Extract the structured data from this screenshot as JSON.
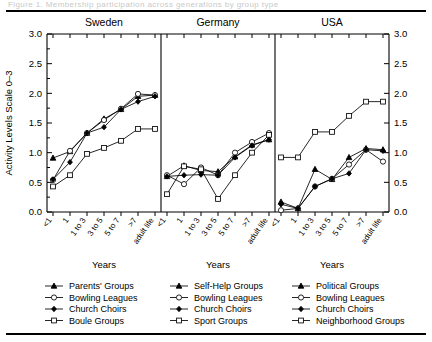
{
  "figure": {
    "ghost_title_fragment": "Figure 1.  Membership participation across generations by group type",
    "y_axis_label": "Activity Levels Scale 0–3",
    "x_axis_label": "Years",
    "y_ticks": [
      "0.0",
      "0.5",
      "1.0",
      "1.5",
      "2.0",
      "2.5",
      "3.0"
    ],
    "x_ticks": [
      "<1",
      "1",
      "1 to 3",
      "3 to 5",
      "5 to 7",
      ">7",
      "adult life"
    ]
  },
  "chart_data": {
    "type": "line",
    "title": "",
    "xlabel": "Years",
    "ylabel": "Activity Levels Scale 0–3",
    "ylim": [
      0,
      3
    ],
    "ytick_step": 0.5,
    "grid": false,
    "legend_position": "bottom",
    "categories": [
      "<1",
      "1",
      "1 to 3",
      "3 to 5",
      "5 to 7",
      ">7",
      "adult life"
    ],
    "panels": [
      {
        "name": "Sweden",
        "series": [
          {
            "name": "Parents' Groups",
            "marker": "triangle-filled",
            "values": [
              0.91,
              1.02,
              1.33,
              1.57,
              1.73,
              1.95,
              1.97
            ]
          },
          {
            "name": "Bowling Leagues",
            "marker": "circle-open",
            "values": [
              0.54,
              1.03,
              1.33,
              1.55,
              1.74,
              1.99,
              1.97
            ]
          },
          {
            "name": "Church Choirs",
            "marker": "diamond-filled",
            "values": [
              0.55,
              0.84,
              1.33,
              1.43,
              1.73,
              1.86,
              1.95
            ]
          },
          {
            "name": "Boule Groups",
            "marker": "square-open",
            "values": [
              0.43,
              0.62,
              0.98,
              1.08,
              1.2,
              1.4,
              1.4
            ]
          }
        ]
      },
      {
        "name": "Germany",
        "series": [
          {
            "name": "Self-Help Groups",
            "marker": "triangle-filled",
            "values": [
              0.6,
              0.78,
              0.7,
              0.68,
              0.93,
              1.13,
              1.22
            ]
          },
          {
            "name": "Bowling Leagues",
            "marker": "circle-open",
            "values": [
              0.62,
              0.47,
              0.75,
              0.62,
              1.0,
              1.18,
              1.33
            ]
          },
          {
            "name": "Church Choirs",
            "marker": "diamond-filled",
            "values": [
              0.6,
              0.62,
              0.63,
              0.62,
              0.92,
              1.12,
              1.22
            ]
          },
          {
            "name": "Sport Groups",
            "marker": "square-open",
            "values": [
              0.3,
              0.77,
              0.72,
              0.22,
              0.62,
              1.0,
              1.3
            ]
          }
        ]
      },
      {
        "name": "USA",
        "series": [
          {
            "name": "Political Groups",
            "marker": "triangle-filled",
            "values": [
              0.17,
              0.06,
              0.72,
              0.55,
              0.92,
              1.07,
              1.05
            ]
          },
          {
            "name": "Bowling Leagues",
            "marker": "circle-open",
            "values": [
              0.03,
              0.06,
              0.43,
              0.56,
              0.8,
              1.05,
              0.85
            ]
          },
          {
            "name": "Church Choirs",
            "marker": "diamond-filled",
            "values": [
              0.13,
              0.06,
              0.43,
              0.56,
              0.65,
              1.05,
              1.03
            ]
          },
          {
            "name": "Neighborhood Groups",
            "marker": "square-open",
            "values": [
              0.92,
              0.92,
              1.35,
              1.35,
              1.62,
              1.86,
              1.86
            ]
          }
        ]
      }
    ]
  },
  "legend": {
    "columns": [
      {
        "panel": "Sweden",
        "entries": [
          {
            "label": "Parents' Groups",
            "marker": "triangle-filled"
          },
          {
            "label": "Bowling Leagues",
            "marker": "circle-open"
          },
          {
            "label": "Church Choirs",
            "marker": "diamond-filled"
          },
          {
            "label": "Boule Groups",
            "marker": "square-open"
          }
        ]
      },
      {
        "panel": "Germany",
        "entries": [
          {
            "label": "Self-Help Groups",
            "marker": "triangle-filled"
          },
          {
            "label": "Bowling Leagues",
            "marker": "circle-open"
          },
          {
            "label": "Church Choirs",
            "marker": "diamond-filled"
          },
          {
            "label": "Sport Groups",
            "marker": "square-open"
          }
        ]
      },
      {
        "panel": "USA",
        "entries": [
          {
            "label": "Political Groups",
            "marker": "triangle-filled"
          },
          {
            "label": "Bowling Leagues",
            "marker": "circle-open"
          },
          {
            "label": "Church Choirs",
            "marker": "diamond-filled"
          },
          {
            "label": "Neighborhood Groups",
            "marker": "square-open"
          }
        ]
      }
    ]
  }
}
